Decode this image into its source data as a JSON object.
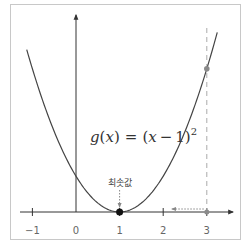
{
  "chart_data": {
    "type": "line",
    "title": "",
    "function_label": {
      "name": "g",
      "var": "x",
      "equals": "=",
      "expr_open": "(",
      "expr_var": "x",
      "expr_minus": "−",
      "expr_const": "1",
      "expr_close": ")",
      "exponent": "2"
    },
    "function": "(x-1)^2",
    "x_range": [
      -1.13,
      3.24
    ],
    "xlim": [
      -1.3,
      3.6
    ],
    "ylim": [
      -0.7,
      5.1
    ],
    "x_ticks": [
      -1,
      0,
      1,
      2,
      3
    ],
    "x_tick_labels": [
      "−1",
      "0",
      "1",
      "2",
      "3"
    ],
    "xlabel": "",
    "ylabel": "",
    "grid": false,
    "points": [
      {
        "name": "minimum",
        "x": 1,
        "y": 0,
        "color": "#111111"
      },
      {
        "name": "value-at-3",
        "x": 3,
        "y": 4,
        "color": "#8a8a8a"
      }
    ],
    "annotations": [
      {
        "text": "최솟값",
        "x": 1,
        "target": "minimum"
      }
    ],
    "vertical_guide_x": 3,
    "curve_color": "#444444",
    "axis_color": "#333333",
    "guide_color": "#aaaaaa"
  }
}
